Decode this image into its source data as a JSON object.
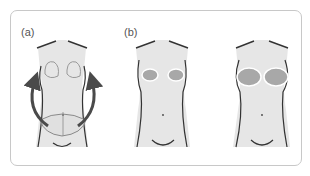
{
  "figure": {
    "panels": [
      {
        "label": "(a)",
        "description": "Torso with outlined breast regions and lower abdominal flap; curved arrows from abdomen up to breasts"
      },
      {
        "label": "(b)",
        "description": "Torso with small reconstructed breast mounds"
      },
      {
        "label": "",
        "description": "Torso with larger reconstructed breast mounds"
      }
    ],
    "colors": {
      "frame": "#c8c8c8",
      "body_fill": "#e6e6e6",
      "outline": "#333333",
      "breast_fill": "#a8a8a8",
      "arrow": "#4a4a4a",
      "flap_line": "#8a8a8a"
    }
  }
}
